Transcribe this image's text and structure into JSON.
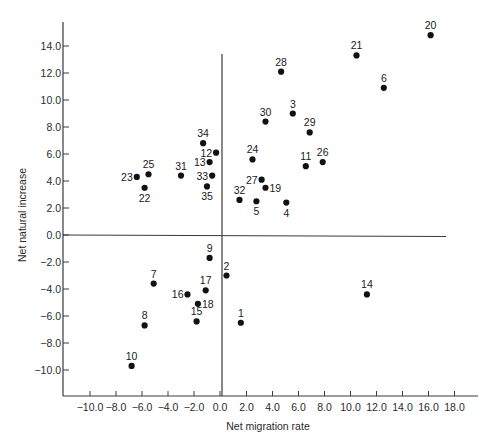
{
  "chart_data": {
    "type": "scatter",
    "title": "",
    "xlabel": "Net migration rate",
    "ylabel": "Net natural increase",
    "xlim": [
      -12.0,
      20.0
    ],
    "ylim": [
      -12.0,
      16.0
    ],
    "grid": false,
    "legend": null,
    "x_ticks": [
      -10.0,
      -8.0,
      -6.0,
      -4.0,
      -2.0,
      0.0,
      2.0,
      4.0,
      6.0,
      8.0,
      10.0,
      12.0,
      14.0,
      16.0,
      18.0
    ],
    "x_tick_labels": [
      "−10.0",
      "−8.0",
      "−6.0",
      "−4.0",
      "−2.0",
      "0.0",
      "2.0",
      "4.0",
      "6.0",
      "8.0",
      "10.0",
      "12.0",
      "14.0",
      "16.0",
      "18.0"
    ],
    "y_ticks": [
      14.0,
      12.0,
      10.0,
      8.0,
      6.0,
      4.0,
      2.0,
      0.0,
      -2.0,
      -4.0,
      -6.0,
      -8.0,
      -10.0
    ],
    "y_tick_labels": [
      "14.0",
      "12.0",
      "10.0",
      "8.0",
      "6.0",
      "4.0",
      "2.0",
      "0.0",
      "−2.0",
      "−4.0",
      "−6.0",
      "−8.0",
      "−10.0"
    ],
    "reference_lines": {
      "x_zero": true,
      "y_zero": true
    },
    "points": [
      {
        "label": "1",
        "x": 1.6,
        "y": -6.5,
        "label_pos": "above"
      },
      {
        "label": "2",
        "x": 0.5,
        "y": -3.0,
        "label_pos": "above"
      },
      {
        "label": "3",
        "x": 5.6,
        "y": 9.0,
        "label_pos": "above"
      },
      {
        "label": "4",
        "x": 5.1,
        "y": 2.4,
        "label_pos": "below"
      },
      {
        "label": "5",
        "x": 2.8,
        "y": 2.5,
        "label_pos": "below"
      },
      {
        "label": "6",
        "x": 12.6,
        "y": 10.9,
        "label_pos": "above"
      },
      {
        "label": "7",
        "x": -5.1,
        "y": -3.6,
        "label_pos": "above"
      },
      {
        "label": "8",
        "x": -5.8,
        "y": -6.7,
        "label_pos": "above"
      },
      {
        "label": "9",
        "x": -0.8,
        "y": -1.7,
        "label_pos": "above"
      },
      {
        "label": "10",
        "x": -6.8,
        "y": -9.7,
        "label_pos": "above"
      },
      {
        "label": "11",
        "x": 6.6,
        "y": 5.1,
        "label_pos": "above"
      },
      {
        "label": "12",
        "x": -0.3,
        "y": 6.1,
        "label_pos": "left"
      },
      {
        "label": "13",
        "x": -0.8,
        "y": 5.4,
        "label_pos": "left"
      },
      {
        "label": "14",
        "x": 11.3,
        "y": -4.4,
        "label_pos": "above"
      },
      {
        "label": "15",
        "x": -1.8,
        "y": -6.4,
        "label_pos": "above"
      },
      {
        "label": "16",
        "x": -2.5,
        "y": -4.4,
        "label_pos": "left"
      },
      {
        "label": "17",
        "x": -1.1,
        "y": -4.1,
        "label_pos": "above"
      },
      {
        "label": "18",
        "x": -1.7,
        "y": -5.1,
        "label_pos": "right"
      },
      {
        "label": "19",
        "x": 3.5,
        "y": 3.5,
        "label_pos": "right"
      },
      {
        "label": "20",
        "x": 16.2,
        "y": 14.8,
        "label_pos": "above"
      },
      {
        "label": "21",
        "x": 10.5,
        "y": 13.3,
        "label_pos": "above"
      },
      {
        "label": "22",
        "x": -5.8,
        "y": 3.5,
        "label_pos": "below"
      },
      {
        "label": "23",
        "x": -6.4,
        "y": 4.3,
        "label_pos": "left"
      },
      {
        "label": "24",
        "x": 2.5,
        "y": 5.6,
        "label_pos": "above"
      },
      {
        "label": "25",
        "x": -5.5,
        "y": 4.5,
        "label_pos": "above"
      },
      {
        "label": "26",
        "x": 7.9,
        "y": 5.4,
        "label_pos": "above"
      },
      {
        "label": "27",
        "x": 3.2,
        "y": 4.1,
        "label_pos": "left"
      },
      {
        "label": "28",
        "x": 4.7,
        "y": 12.1,
        "label_pos": "above"
      },
      {
        "label": "29",
        "x": 6.9,
        "y": 7.6,
        "label_pos": "above"
      },
      {
        "label": "30",
        "x": 3.5,
        "y": 8.4,
        "label_pos": "above"
      },
      {
        "label": "31",
        "x": -3.0,
        "y": 4.4,
        "label_pos": "above"
      },
      {
        "label": "32",
        "x": 1.5,
        "y": 2.6,
        "label_pos": "above"
      },
      {
        "label": "33",
        "x": -0.6,
        "y": 4.4,
        "label_pos": "left"
      },
      {
        "label": "34",
        "x": -1.3,
        "y": 6.8,
        "label_pos": "above"
      },
      {
        "label": "35",
        "x": -1.0,
        "y": 3.6,
        "label_pos": "below"
      }
    ]
  },
  "style": {
    "axis_color": "#3a3a3a",
    "point_color": "#111111",
    "text_color": "#2a2a2a",
    "background": "#ffffff"
  }
}
